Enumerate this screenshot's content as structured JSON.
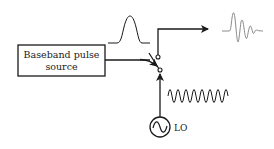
{
  "diagram": {
    "blocks": [
      {
        "id": "baseband",
        "line1": "Baseband pulse",
        "line2": "source"
      }
    ],
    "labels": {
      "lo": "LO"
    },
    "signals": {
      "input_pulse": "gaussian-pulse",
      "lo_waveform": "sinusoid",
      "output": "modulated-wavelet"
    },
    "edges": [
      {
        "from": "baseband",
        "to": "switch",
        "type": "arrow"
      },
      {
        "from": "lo",
        "to": "switch",
        "type": "arrow"
      },
      {
        "from": "switch",
        "to": "output",
        "type": "arrow"
      }
    ],
    "colors": {
      "stroke": "#1a1a1a",
      "output_wave": "#8a8a8a"
    }
  }
}
